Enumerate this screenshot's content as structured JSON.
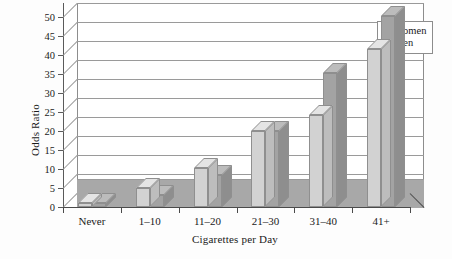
{
  "chart_data": {
    "type": "bar",
    "title": "",
    "subtitle": "",
    "xlabel": "Cigarettes per Day",
    "ylabel": "Odds Ratio",
    "categories": [
      "Never",
      "1–10",
      "11–20",
      "21–30",
      "31–40",
      "41+"
    ],
    "series": [
      {
        "name": "Women",
        "color": "#d2d2d2",
        "values": [
          1.0,
          5.1,
          10.2,
          20.1,
          24.2,
          41.5
        ]
      },
      {
        "name": "Men",
        "color": "#a3a3a3",
        "values": [
          1.0,
          3.2,
          8.3,
          20.1,
          35.2,
          50.2
        ]
      }
    ],
    "ylim": [
      0,
      50
    ],
    "yticks": [
      0,
      5,
      10,
      15,
      20,
      25,
      30,
      35,
      40,
      45,
      50
    ],
    "ytick_labels": [
      "0",
      "5",
      "10",
      "15",
      "20",
      "25",
      "30",
      "35",
      "40",
      "45",
      "50"
    ],
    "grid": true,
    "grid_axis": "y",
    "legend_position": "top-right",
    "style": "3d-grouped-bar"
  },
  "legend": {
    "items": [
      {
        "label": "Women",
        "swatch": "#d2d2d2"
      },
      {
        "label": "Men",
        "swatch": "#a3a3a3"
      }
    ]
  },
  "axes": {
    "y_title": "Odds Ratio",
    "x_title": "Cigarettes per Day"
  }
}
